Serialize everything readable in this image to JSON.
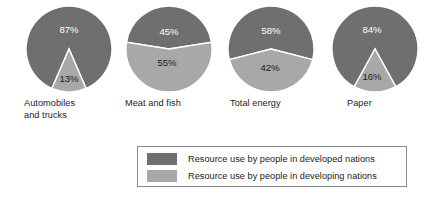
{
  "chart_data": {
    "type": "pie",
    "title": "",
    "subtitle": "",
    "xlabel": "",
    "ylabel": "",
    "legend_position": "bottom-center",
    "grid": false,
    "categories": [
      "Automobiles and trucks",
      "Meat and fish",
      "Total energy",
      "Paper"
    ],
    "series": [
      {
        "name": "Resource use by people in developed nations",
        "color": "#706f6f",
        "values": [
          87,
          45,
          58,
          84
        ]
      },
      {
        "name": "Resource use by people in developing nations",
        "color": "#a8a8a8",
        "values": [
          13,
          55,
          42,
          16
        ]
      }
    ],
    "units": "percent",
    "charts": [
      {
        "label": "Automobiles\nand trucks",
        "label_line1": "Automobiles",
        "label_line2": "and trucks",
        "slices": [
          {
            "series": "developed",
            "value": 87,
            "display": "87%",
            "color": "#706f6f",
            "text_color": "#ffffff"
          },
          {
            "series": "developing",
            "value": 13,
            "display": "13%",
            "color": "#a8a8a8",
            "text_color": "#1c1c1c"
          }
        ]
      },
      {
        "label": "Meat and fish",
        "label_line1": "Meat and fish",
        "label_line2": "",
        "slices": [
          {
            "series": "developed",
            "value": 45,
            "display": "45%",
            "color": "#706f6f",
            "text_color": "#ffffff"
          },
          {
            "series": "developing",
            "value": 55,
            "display": "55%",
            "color": "#a8a8a8",
            "text_color": "#1c1c1c"
          }
        ]
      },
      {
        "label": "Total energy",
        "label_line1": "Total energy",
        "label_line2": "",
        "slices": [
          {
            "series": "developed",
            "value": 58,
            "display": "58%",
            "color": "#706f6f",
            "text_color": "#ffffff"
          },
          {
            "series": "developing",
            "value": 42,
            "display": "42%",
            "color": "#a8a8a8",
            "text_color": "#1c1c1c"
          }
        ]
      },
      {
        "label": "Paper",
        "label_line1": "Paper",
        "label_line2": "",
        "slices": [
          {
            "series": "developed",
            "value": 84,
            "display": "84%",
            "color": "#706f6f",
            "text_color": "#ffffff"
          },
          {
            "series": "developing",
            "value": 16,
            "display": "16%",
            "color": "#a8a8a8",
            "text_color": "#1c1c1c"
          }
        ]
      }
    ]
  },
  "legend": {
    "items": [
      {
        "label": "Resource use by people in developed nations",
        "color": "#706f6f"
      },
      {
        "label": "Resource use by people in developing nations",
        "color": "#a8a8a8"
      }
    ]
  },
  "colors": {
    "developed": "#706f6f",
    "developing": "#a8a8a8",
    "separator": "#ffffff",
    "legend_border": "#8a8a8a",
    "text": "#1c1c1c",
    "background": "#ffffff"
  }
}
